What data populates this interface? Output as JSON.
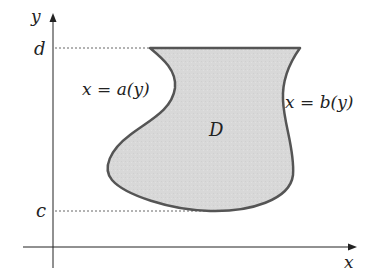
{
  "diagram": {
    "axis_labels": {
      "x": "x",
      "y": "y"
    },
    "bound_labels": {
      "top": "d",
      "bottom": "c"
    },
    "curve_labels": {
      "left": "x = a(y)",
      "right": "x = b(y)"
    },
    "region_label": "D",
    "colors": {
      "region_fill": "#d9d9d9",
      "region_stroke": "#555555",
      "axis": "#222222",
      "dotted": "#666666"
    }
  }
}
